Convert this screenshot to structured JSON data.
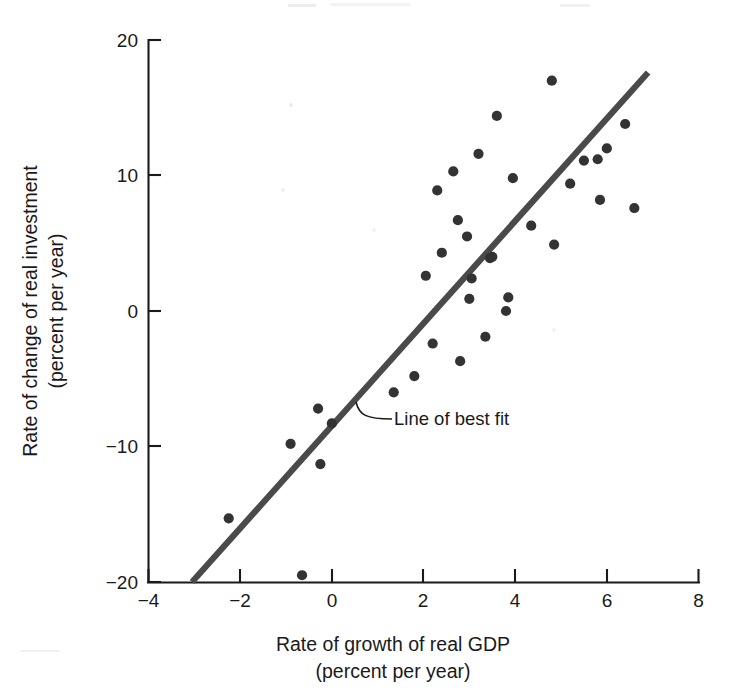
{
  "chart_data": {
    "type": "scatter",
    "title": "",
    "xlabel": "Rate of growth of real GDP",
    "xlabel_sub": "(percent per year)",
    "ylabel": "Rate of change of real investment",
    "ylabel_sub": "(percent per year)",
    "xlim": [
      -4,
      8
    ],
    "ylim": [
      -20,
      20
    ],
    "xticks": [
      -4,
      -2,
      0,
      2,
      4,
      6,
      8
    ],
    "yticks": [
      -20,
      -10,
      0,
      10,
      20
    ],
    "xtick_labels": [
      "−4",
      "−2",
      "0",
      "2",
      "4",
      "6",
      "8"
    ],
    "ytick_labels": [
      "−20",
      "−10",
      "0",
      "10",
      "20"
    ],
    "grid": false,
    "legend": "none",
    "marker_color": "#333333",
    "line_color": "#4a4a4a",
    "annotations": [
      {
        "name": "line-of-best-fit-label",
        "text": "Line of best fit",
        "x": 1.4,
        "y": -7.9
      }
    ],
    "series": [
      {
        "name": "country observations",
        "type": "scatter",
        "points": [
          [
            -2.25,
            -15.3
          ],
          [
            -0.9,
            -9.8
          ],
          [
            -0.65,
            -19.5
          ],
          [
            -0.3,
            -7.2
          ],
          [
            -0.25,
            -11.3
          ],
          [
            0.0,
            -8.3
          ],
          [
            1.35,
            -6.0
          ],
          [
            1.8,
            -4.8
          ],
          [
            2.05,
            2.6
          ],
          [
            2.2,
            -2.4
          ],
          [
            2.3,
            8.9
          ],
          [
            2.4,
            4.3
          ],
          [
            2.65,
            10.3
          ],
          [
            2.75,
            6.7
          ],
          [
            2.8,
            -3.7
          ],
          [
            2.95,
            5.5
          ],
          [
            3.0,
            0.9
          ],
          [
            3.05,
            2.4
          ],
          [
            3.2,
            11.6
          ],
          [
            3.35,
            -1.9
          ],
          [
            3.45,
            3.9
          ],
          [
            3.5,
            4.0
          ],
          [
            3.6,
            14.4
          ],
          [
            3.8,
            0.0
          ],
          [
            3.85,
            1.0
          ],
          [
            3.95,
            9.8
          ],
          [
            4.35,
            6.3
          ],
          [
            4.8,
            17.0
          ],
          [
            4.85,
            4.9
          ],
          [
            5.2,
            9.4
          ],
          [
            5.5,
            11.1
          ],
          [
            5.8,
            11.2
          ],
          [
            5.85,
            8.2
          ],
          [
            6.0,
            12.0
          ],
          [
            6.4,
            13.8
          ],
          [
            6.6,
            7.6
          ]
        ]
      },
      {
        "name": "line of best fit",
        "type": "line",
        "points": [
          [
            -3.05,
            -20.0
          ],
          [
            6.9,
            17.6
          ]
        ]
      }
    ]
  },
  "figure": {
    "name": "scatter-plot-gdp-investment"
  }
}
